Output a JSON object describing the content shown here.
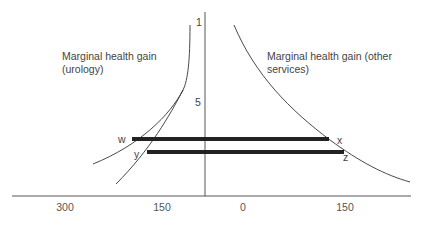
{
  "diagram": {
    "curve_labels": {
      "urology_line1": "Marginal health gain",
      "urology_line2": "(urology)",
      "other_line1": "Marginal health gain (other",
      "other_line2": "services)"
    },
    "vertical_axis_labels": {
      "top": "1",
      "middle": "5"
    },
    "point_labels": {
      "w": "w",
      "x": "x",
      "y": "y",
      "z": "z"
    },
    "x_axis_ticks": [
      "300",
      "150",
      "0",
      "150"
    ],
    "colors": {
      "line": "#333333",
      "bar": "#222222",
      "text": "#444444"
    }
  }
}
